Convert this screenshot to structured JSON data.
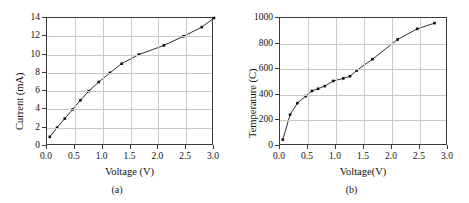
{
  "figure": {
    "panels": [
      {
        "caption": "(a)",
        "xlabel": "Voltage (V)",
        "ylabel": "Current (mA)",
        "xticks": [
          "0.0",
          "0.5",
          "1.0",
          "1.5",
          "2.0",
          "2.5",
          "3.0"
        ],
        "yticks": [
          "0",
          "2",
          "4",
          "6",
          "8",
          "10",
          "12",
          "14"
        ]
      },
      {
        "caption": "(b)",
        "xlabel": "Voltage(V)",
        "ylabel": "Temperature (C)",
        "xticks": [
          "0.0",
          "0.5",
          "1.0",
          "1.5",
          "2.0",
          "2.5",
          "3.0"
        ],
        "yticks": [
          "0",
          "200",
          "400",
          "600",
          "800",
          "1000"
        ]
      }
    ]
  },
  "chart_data": [
    {
      "type": "line",
      "title": "",
      "panel_label": "(a)",
      "xlabel": "Voltage (V)",
      "ylabel": "Current (mA)",
      "xlim": [
        0.0,
        3.0
      ],
      "ylim": [
        0,
        14
      ],
      "xticks": [
        0.0,
        0.5,
        1.0,
        1.5,
        2.0,
        2.5,
        3.0
      ],
      "yticks": [
        0,
        2,
        4,
        6,
        8,
        10,
        12,
        14
      ],
      "grid": true,
      "legend": null,
      "marker": "square",
      "series": [
        {
          "name": "Current vs Voltage",
          "x": [
            0.05,
            0.18,
            0.32,
            0.46,
            0.6,
            0.75,
            0.93,
            1.13,
            1.34,
            1.65,
            2.1,
            2.45,
            2.78,
            3.0
          ],
          "y": [
            1.0,
            2.0,
            3.0,
            4.0,
            5.0,
            6.0,
            7.0,
            8.0,
            9.0,
            10.0,
            11.0,
            12.0,
            13.0,
            14.0
          ]
        }
      ]
    },
    {
      "type": "line",
      "title": "",
      "panel_label": "(b)",
      "xlabel": "Voltage(V)",
      "ylabel": "Temperature (C)",
      "xlim": [
        0.0,
        3.0
      ],
      "ylim": [
        0,
        1000
      ],
      "xticks": [
        0.0,
        0.5,
        1.0,
        1.5,
        2.0,
        2.5,
        3.0
      ],
      "yticks": [
        0,
        200,
        400,
        600,
        800,
        1000
      ],
      "grid": true,
      "legend": null,
      "marker": "square",
      "series": [
        {
          "name": "Temperature vs Voltage",
          "x": [
            0.05,
            0.18,
            0.31,
            0.46,
            0.57,
            0.68,
            0.8,
            0.95,
            1.13,
            1.25,
            1.37,
            1.65,
            2.1,
            2.45,
            2.76
          ],
          "y": [
            50,
            245,
            335,
            390,
            430,
            447,
            468,
            508,
            528,
            545,
            590,
            678,
            832,
            915,
            960
          ]
        }
      ]
    }
  ]
}
